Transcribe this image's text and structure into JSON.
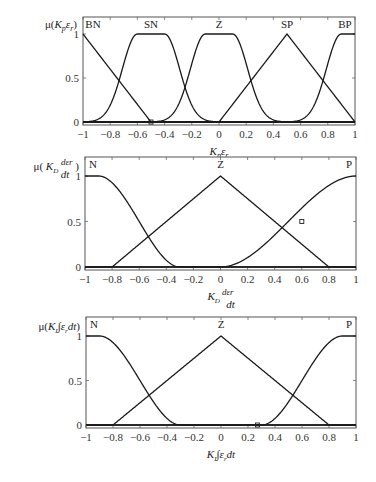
{
  "chart_data": [
    {
      "type": "line",
      "title": "",
      "ylabel": "μ(K_p ε_r)",
      "xlabel": "K_p ε_r",
      "xlim": [
        -1,
        1
      ],
      "ylim": [
        0,
        1
      ],
      "xticks": [
        "-1",
        "-0.8",
        "-0.6",
        "-0.4",
        "-0.2",
        "0",
        "0.2",
        "0.4",
        "0.6",
        "0.8",
        "1"
      ],
      "yticks": [
        "0",
        "0.5",
        "1"
      ],
      "legend": [
        "BN",
        "SN",
        "Z",
        "SP",
        "BP"
      ],
      "series": [
        {
          "name": "BN",
          "shape": "triangle",
          "points": [
            [
              -1,
              1
            ],
            [
              -0.5,
              0
            ],
            [
              1,
              0
            ]
          ]
        },
        {
          "name": "SN",
          "shape": "gaussian-flat",
          "center_left": -0.6,
          "center_right": -0.4,
          "sigma": 0.11
        },
        {
          "name": "Z",
          "shape": "gaussian-flat",
          "center_left": -0.1,
          "center_right": 0.1,
          "sigma": 0.11
        },
        {
          "name": "SP",
          "shape": "triangle",
          "points": [
            [
              -1,
              0
            ],
            [
              0,
              0
            ],
            [
              0.5,
              1
            ],
            [
              1,
              0
            ]
          ]
        },
        {
          "name": "BP",
          "shape": "gaussian-flat",
          "center_left": 0.9,
          "center_right": 1.0,
          "sigma": 0.11
        }
      ],
      "marker_points": [
        [
          -0.5,
          0
        ]
      ]
    },
    {
      "type": "line",
      "ylabel": "μ(K_D dε_r/dt)",
      "xlabel": "K_D dε_r/dt",
      "xlim": [
        -1,
        1
      ],
      "ylim": [
        0,
        1
      ],
      "xticks": [
        "-1",
        "-0.8",
        "-0.6",
        "-0.4",
        "-0.2",
        "0",
        "0.2",
        "0.4",
        "0.6",
        "0.8",
        "1"
      ],
      "yticks": [
        "0",
        "0.5",
        "1"
      ],
      "legend": [
        "N",
        "Z",
        "P"
      ],
      "series": [
        {
          "name": "N",
          "shape": "z-sigmoid",
          "flat_to": -0.9,
          "zero_at": -0.3
        },
        {
          "name": "Z",
          "shape": "triangle",
          "points": [
            [
              -1,
              0
            ],
            [
              -0.8,
              0
            ],
            [
              0,
              1
            ],
            [
              0.8,
              0
            ],
            [
              1,
              0
            ]
          ]
        },
        {
          "name": "P",
          "shape": "s-sigmoid",
          "zero_at": 0.0,
          "flat_from": 1.0
        }
      ],
      "marker_points": [
        [
          0.6,
          0.5
        ]
      ]
    },
    {
      "type": "line",
      "ylabel": "μ(K_I ∫ε_r dt)",
      "xlabel": "K_I ∫ε_r dt",
      "xlim": [
        -1,
        1
      ],
      "ylim": [
        0,
        1
      ],
      "xticks": [
        "-1",
        "-0.8",
        "-0.6",
        "-0.4",
        "-0.2",
        "0",
        "0.2",
        "0.4",
        "0.6",
        "0.8",
        "1"
      ],
      "yticks": [
        "0",
        "0.5",
        "1"
      ],
      "legend": [
        "N",
        "Z",
        "P"
      ],
      "series": [
        {
          "name": "N",
          "shape": "z-sigmoid",
          "flat_to": -0.9,
          "zero_at": -0.3
        },
        {
          "name": "Z",
          "shape": "triangle",
          "points": [
            [
              -1,
              0
            ],
            [
              -0.8,
              0
            ],
            [
              0,
              1
            ],
            [
              0.8,
              0
            ],
            [
              1,
              0
            ]
          ]
        },
        {
          "name": "P",
          "shape": "s-sigmoid",
          "zero_at": 0.3,
          "flat_from": 0.9
        }
      ],
      "marker_points": [
        [
          0.27,
          0
        ]
      ]
    }
  ],
  "plots": [
    {
      "box": {
        "left": 83,
        "top": 17,
        "right": 355,
        "y1": 34,
        "y0": 122,
        "bottom": 125
      },
      "ylabel_parts": {
        "mu": "μ(",
        "var": "K",
        "sub": "p",
        "eps": "ε",
        "epssub": "r",
        "close": ")"
      },
      "xlabel_parts": {
        "var": "K",
        "sub": "p",
        "eps": "ε",
        "epssub": "r"
      }
    },
    {
      "box": {
        "left": 85,
        "top": 157,
        "right": 356,
        "y1": 176,
        "y0": 267,
        "bottom": 270
      },
      "ylabel_parts": {
        "mu": "μ",
        "var": "K",
        "sub": "D",
        "num": "dε",
        "numsub": "r",
        "den": "dt"
      },
      "xlabel_parts": {
        "var": "K",
        "sub": "D",
        "num": "dε",
        "numsub": "r",
        "den": "dt"
      }
    },
    {
      "box": {
        "left": 86,
        "top": 317,
        "right": 356,
        "y1": 336,
        "y0": 425,
        "bottom": 428
      },
      "ylabel_parts": {
        "mu": "μ(",
        "var": "K",
        "sub": "I",
        "int": "∫",
        "eps": "ε",
        "epssub": "r",
        "dt": "dt",
        "close": ")"
      },
      "xlabel_parts": {
        "var": "K",
        "sub": "I",
        "int": "∫",
        "eps": "ε",
        "epssub": "r",
        "dt": "dt"
      }
    }
  ]
}
